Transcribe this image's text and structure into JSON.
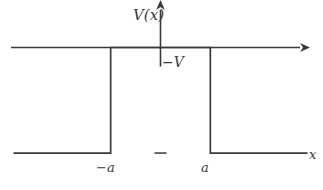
{
  "figure": {
    "title": "",
    "background_color": "#ffffff",
    "line_color": "#3a3a3a",
    "axis_color": "#3a3a3a",
    "line_width": 1.6
  },
  "labels": {
    "y_axis": "V(x)",
    "y_axis_var": "V",
    "y_axis_arg": "x",
    "x_axis": "x",
    "level_neg_v": "−V",
    "tick_neg_a": "−a",
    "tick_a": "a"
  },
  "chart_data": {
    "type": "line",
    "title": "",
    "xlabel": "x",
    "ylabel": "V(x)",
    "legend": [],
    "grid": false,
    "xlim": [
      -3.0,
      3.0
    ],
    "ylim": [
      -1.35,
      0.45
    ],
    "xticks": [
      -1,
      1
    ],
    "xticklabels": [
      "−a",
      "a"
    ],
    "yticks": [
      -1
    ],
    "yticklabels": [
      "−V"
    ],
    "annotations": [
      {
        "text": "−V",
        "x": 0.12,
        "y": -1.0
      },
      {
        "text": "−a",
        "x": -1.0,
        "y": -0.12
      },
      {
        "text": "a",
        "x": 1.0,
        "y": -0.12
      },
      {
        "text": "V(x)",
        "x": 0.0,
        "y": 0.42
      },
      {
        "text": "x",
        "x": 2.95,
        "y": -0.08
      }
    ],
    "series": [
      {
        "name": "V(x)",
        "x": [
          -2.95,
          -1.0,
          -1.0,
          1.0,
          1.0,
          2.95
        ],
        "values": [
          -1.0,
          -1.0,
          0.0,
          0.0,
          -1.0,
          -1.0
        ]
      }
    ]
  },
  "axes": {
    "x_axis_arrow": true,
    "y_axis_arrow": true,
    "origin_label": ""
  }
}
